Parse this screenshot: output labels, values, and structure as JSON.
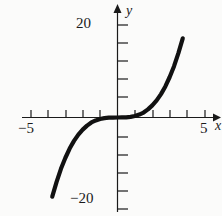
{
  "figure": {
    "background_color": "#fbfbfa",
    "curve_color": "#111111",
    "axis_color": "#1a1a1a"
  },
  "axes": {
    "x_name": "x",
    "y_name": "y",
    "x_left_label": "−5",
    "x_right_label": "5",
    "y_top_label": "20",
    "y_bottom_label": "−20"
  },
  "chart_data": {
    "type": "line",
    "title": "",
    "xlabel": "x",
    "ylabel": "y",
    "xlim": [
      -5.6,
      5.6
    ],
    "ylim": [
      -22.5,
      22.5
    ],
    "grid": false,
    "legend": null,
    "x_ticks": [
      -5,
      -4,
      -3,
      -2,
      -1,
      1,
      2,
      3,
      4,
      5
    ],
    "x_tick_labels": [
      "−5",
      "",
      "",
      "",
      "",
      "",
      "",
      "",
      "",
      "5"
    ],
    "y_ticks": [
      -20,
      -16,
      -12,
      -8,
      -4,
      4,
      8,
      12,
      16,
      20
    ],
    "y_tick_labels": [
      "−20",
      "",
      "",
      "",
      "",
      "",
      "",
      "",
      "",
      "20"
    ],
    "series": [
      {
        "name": "cubic",
        "equation": "y = x^3 / 3",
        "x": [
          -4.5,
          -4.25,
          -4,
          -3.75,
          -3.5,
          -3.25,
          -3,
          -2.75,
          -2.5,
          -2.25,
          -2,
          -1.75,
          -1.5,
          -1.25,
          -1,
          -0.75,
          -0.5,
          -0.25,
          0,
          0.25,
          0.5,
          0.75,
          1,
          1.25,
          1.5,
          1.75,
          2,
          2.25,
          2.5,
          2.75,
          3,
          3.25,
          3.5,
          3.75,
          4,
          4.25,
          4.35
        ],
        "y": [
          -30.4,
          -25.6,
          -21.3,
          -17.6,
          -14.3,
          -11.4,
          -9,
          -6.9,
          -5.2,
          -3.8,
          -2.7,
          -1.8,
          -1.1,
          -0.65,
          -0.33,
          -0.14,
          -0.04,
          -0.01,
          0,
          0.01,
          0.04,
          0.14,
          0.33,
          0.65,
          1.1,
          1.8,
          2.7,
          3.8,
          5.2,
          6.9,
          9,
          11.4,
          14.3,
          17.6,
          21.3,
          25.6,
          27.4
        ]
      }
    ]
  }
}
